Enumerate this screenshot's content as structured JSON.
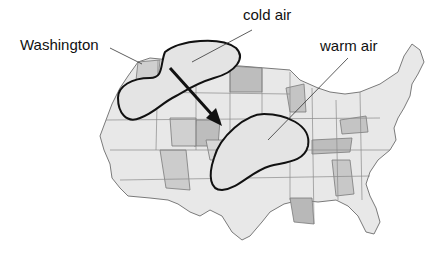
{
  "labels": {
    "washington": "Washington",
    "cold_air": "cold air",
    "warm_air": "warm air"
  },
  "colors": {
    "state_light": "#ebebeb",
    "state_mid": "#d2d2d2",
    "state_dark": "#b4b4b4",
    "air_mass_fill": "#e4e4e4",
    "outline": "#111111",
    "border": "#7a7a7a"
  },
  "map": {
    "subject": "contiguous United States",
    "arrow": "movement of cold air mass from northwest toward center"
  }
}
